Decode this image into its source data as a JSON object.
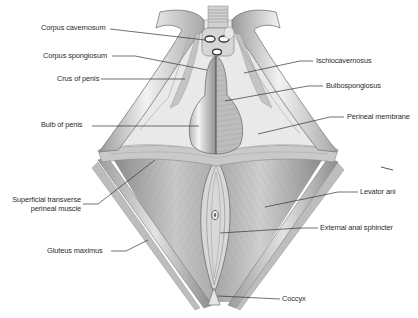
{
  "diagram": {
    "colors": {
      "background": "#ffffff",
      "tissue_light": "#ececec",
      "tissue_mid": "#bdbdbd",
      "tissue_dark": "#7a7a7a",
      "leader_line": "#333333",
      "label_text": "#2b2b2b"
    },
    "labels_left": [
      {
        "id": "corpus-cavernosum",
        "text": "Corpus cavernosum",
        "x": 41,
        "y": 24,
        "line": [
          [
            110,
            29
          ],
          [
            205,
            40
          ]
        ]
      },
      {
        "id": "corpus-spongiosum",
        "text": "Corpus spongiosum",
        "x": 43,
        "y": 52,
        "line": [
          [
            112,
            56
          ],
          [
            135,
            56
          ],
          [
            207,
            70
          ]
        ]
      },
      {
        "id": "crus-of-penis",
        "text": "Crus of penis",
        "x": 57,
        "y": 75,
        "line": [
          [
            101,
            79
          ],
          [
            185,
            79
          ]
        ]
      },
      {
        "id": "bulb-of-penis",
        "text": "Bulb of penis",
        "x": 41,
        "y": 121,
        "line": [
          [
            92,
            126
          ],
          [
            199,
            126
          ]
        ]
      },
      {
        "id": "superficial-transverse-perineal-muscle",
        "text": [
          "Superficial transverse",
          "perineal muscle"
        ],
        "x": 8,
        "y": 196,
        "line": [
          [
            83,
            204
          ],
          [
            98,
            204
          ],
          [
            155,
            160
          ]
        ]
      },
      {
        "id": "gluteus-maximus",
        "text": "Gluteus maximus",
        "x": 47,
        "y": 247,
        "line": [
          [
            111,
            251
          ],
          [
            126,
            251
          ],
          [
            148,
            240
          ]
        ]
      }
    ],
    "labels_right": [
      {
        "id": "ischiocavernosus",
        "text": "Ischiocavernosus",
        "x": 316,
        "y": 57,
        "line": [
          [
            313,
            61
          ],
          [
            300,
            61
          ],
          [
            244,
            73
          ]
        ]
      },
      {
        "id": "bulbospongiosus",
        "text": "Bulbospongiosus",
        "x": 326,
        "y": 82,
        "line": [
          [
            323,
            86
          ],
          [
            308,
            86
          ],
          [
            225,
            101
          ]
        ]
      },
      {
        "id": "perineal-membrane",
        "text": "Perineal membrane",
        "x": 347,
        "y": 113,
        "line": [
          [
            344,
            117
          ],
          [
            330,
            117
          ],
          [
            258,
            134
          ]
        ]
      },
      {
        "id": "levator-ani",
        "text": "Levator ani",
        "x": 360,
        "y": 188,
        "line": [
          [
            358,
            192
          ],
          [
            338,
            192
          ],
          [
            265,
            207
          ]
        ]
      },
      {
        "id": "external-anal-sphincter",
        "text": "External anal sphincter",
        "x": 320,
        "y": 224,
        "line": [
          [
            318,
            228
          ],
          [
            300,
            228
          ],
          [
            220,
            233
          ]
        ]
      },
      {
        "id": "coccyx",
        "text": "Coccyx",
        "x": 282,
        "y": 295,
        "line": [
          [
            280,
            299
          ],
          [
            218,
            296
          ]
        ]
      }
    ]
  }
}
